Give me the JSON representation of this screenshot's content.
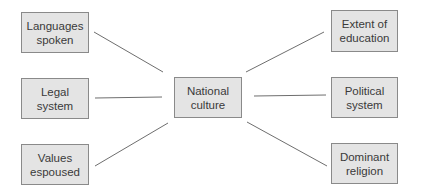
{
  "diagram": {
    "center": {
      "label": "National\nculture"
    },
    "left": [
      {
        "label": "Languages\nspoken"
      },
      {
        "label": "Legal\nsystem"
      },
      {
        "label": "Values\nespoused"
      }
    ],
    "right": [
      {
        "label": "Extent of\neducation"
      },
      {
        "label": "Political\nsystem"
      },
      {
        "label": "Dominant\nreligion"
      }
    ],
    "colors": {
      "box_fill": "#e4e4e4",
      "box_border": "#8a8a8a",
      "line": "#6e6e6e",
      "text": "#3a3a3a"
    }
  }
}
